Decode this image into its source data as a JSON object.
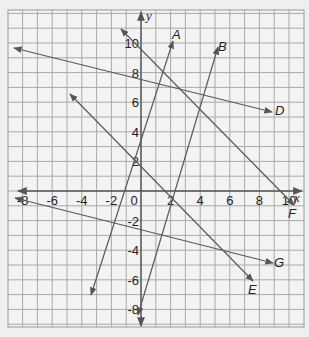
{
  "figure": {
    "background": "#efefef",
    "grid_color": "#9a9a9a",
    "grid_bg": "#f2f2f2",
    "axis_color": "#555555",
    "line_color": "#5a5a5a",
    "x_axis_label": "x",
    "y_axis_label": "y",
    "x_range": [
      -9,
      11
    ],
    "y_range": [
      -9,
      12
    ],
    "x_ticks": [
      {
        "value": -8,
        "label": "-8"
      },
      {
        "value": -6,
        "label": "-6"
      },
      {
        "value": -4,
        "label": "-4"
      },
      {
        "value": -2,
        "label": "-2"
      },
      {
        "value": 0,
        "label": "0"
      },
      {
        "value": 2,
        "label": "2"
      },
      {
        "value": 4,
        "label": "4"
      },
      {
        "value": 6,
        "label": "6"
      },
      {
        "value": 8,
        "label": "8"
      },
      {
        "value": 10,
        "label": "10"
      }
    ],
    "y_ticks": [
      {
        "value": 10,
        "label": "10"
      },
      {
        "value": 8,
        "label": "8"
      },
      {
        "value": 6,
        "label": "6"
      },
      {
        "value": 4,
        "label": "4"
      },
      {
        "value": 2,
        "label": "2"
      },
      {
        "value": -2,
        "label": "-2"
      },
      {
        "value": -4,
        "label": "-4"
      },
      {
        "value": -6,
        "label": "-6"
      },
      {
        "value": -8,
        "label": "-8"
      }
    ],
    "lines": [
      {
        "name": "A",
        "label": "A"
      },
      {
        "name": "B",
        "label": "B"
      },
      {
        "name": "D",
        "label": "D"
      },
      {
        "name": "E",
        "label": "E"
      },
      {
        "name": "F",
        "label": "F"
      },
      {
        "name": "G",
        "label": "G"
      }
    ]
  }
}
